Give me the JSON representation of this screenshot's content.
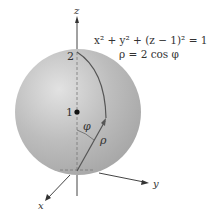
{
  "figure": {
    "equation_cartesian": "x² + y² + (z − 1)² = 1",
    "equation_spherical": "ρ = 2 cos φ",
    "axes": {
      "x": "x",
      "y": "y",
      "z": "z"
    },
    "ticks": {
      "z_top": "2",
      "z_center": "1"
    },
    "angle_label": "φ",
    "radius_label": "ρ",
    "colors": {
      "sphere": "#b8b8b8",
      "sphere_highlight": "#dedede",
      "axis": "#444444",
      "curve": "#555555"
    }
  }
}
